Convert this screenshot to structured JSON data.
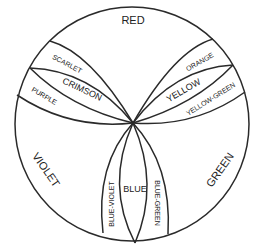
{
  "diagram": {
    "stroke_color": "#2a2a2a",
    "background": "#ffffff",
    "labels": {
      "red": "RED",
      "scarlet": "SCARLET",
      "crimson": "CRIMSON",
      "purple": "PURPLE",
      "orange": "ORANGE",
      "yellow": "YELLOW",
      "yellow_green": "YELLOW-GREEN",
      "violet": "VIOLET",
      "green": "GREEN",
      "blue_violet": "BLUE-VIOLET",
      "blue": "BLUE",
      "blue_green": "BLUE-GREEN"
    }
  }
}
